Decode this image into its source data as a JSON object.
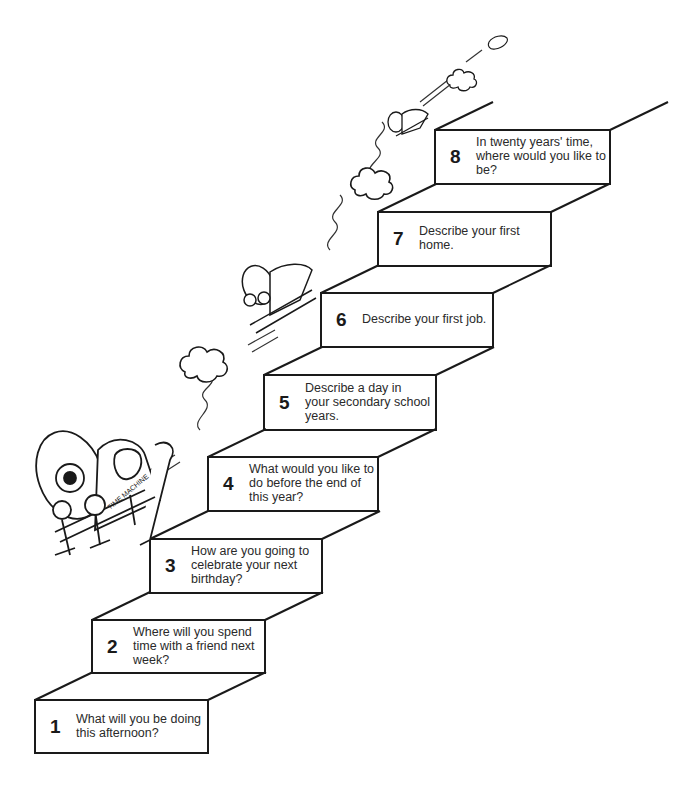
{
  "steps": [
    {
      "number": "1",
      "question": "What will you be doing\nthis afternoon?"
    },
    {
      "number": "2",
      "question": "Where will you spend\ntime with a friend next\nweek?"
    },
    {
      "number": "3",
      "question": "How are you going to\ncelebrate your next\nbirthday?"
    },
    {
      "number": "4",
      "question": "What would you like to\ndo before the end of\nthis year?"
    },
    {
      "number": "5",
      "question": "Describe a day in\nyour secondary school\nyears."
    },
    {
      "number": "6",
      "question": "Describe your first job."
    },
    {
      "number": "7",
      "question": "Describe your first\nhome."
    },
    {
      "number": "8",
      "question": "In twenty years' time,\nwhere would you like to\nbe?"
    }
  ],
  "illustration": {
    "vehicle_label": "TIME MACHINE",
    "icons": [
      "time-machine-sleigh-icon",
      "smoke-cloud-icon"
    ]
  },
  "colors": {
    "line": "#1a1a1a",
    "background": "#ffffff"
  }
}
